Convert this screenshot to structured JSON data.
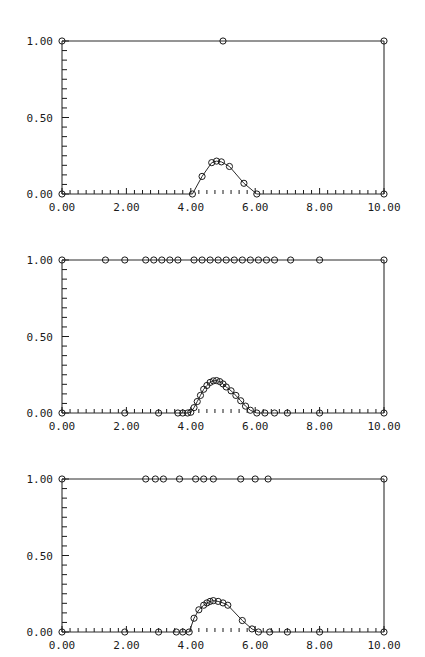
{
  "figure": {
    "title": "",
    "background_color": "#ffffff",
    "line_color": "#2a2a2a",
    "marker_color": "#1a1a1a",
    "axis_color": "#1a1a1a",
    "panel_count": 3,
    "layout": "3 stacked panels, shared axis style"
  },
  "axes": {
    "xlim": [
      0,
      10
    ],
    "ylim": [
      0,
      1
    ],
    "xticks": [
      0,
      2,
      4,
      6,
      8,
      10
    ],
    "xtick_labels": [
      "0.00",
      "2.00",
      "4.00",
      "6.00",
      "8.00",
      "10.00"
    ],
    "yticks": [
      0,
      0.5,
      1
    ],
    "ytick_labels": [
      "0.00",
      "0.50",
      "1.00"
    ],
    "x_minor_interval": 0.25,
    "y_minor_interval": 0.0625,
    "grid": false,
    "xlabel": "",
    "ylabel": ""
  },
  "chart_data": {
    "type": "line",
    "title": "",
    "xlabel": "",
    "ylabel": "",
    "xlim": [
      0,
      10
    ],
    "ylim": [
      0,
      1
    ],
    "xticks": [
      0,
      2,
      4,
      6,
      8,
      10
    ],
    "xtick_labels": [
      "0.00",
      "2.00",
      "4.00",
      "6.00",
      "8.00",
      "10.00"
    ],
    "yticks": [
      0,
      0.5,
      1
    ],
    "ytick_labels": [
      "0.00",
      "0.50",
      "1.00"
    ],
    "grid": false,
    "legend": "none",
    "marker": "open-circle",
    "panels": [
      {
        "name": "panel-1",
        "index": 0,
        "description": "coarse sampling: sparse markers, 3 points on upper line, 9 points on lower curve",
        "series": [
          {
            "name": "upper",
            "x": [
              0.0,
              5.0,
              10.0
            ],
            "y": [
              1.0,
              1.0,
              1.0
            ]
          },
          {
            "name": "lower",
            "x": [
              0.0,
              4.05,
              4.35,
              4.65,
              4.8,
              4.95,
              5.2,
              5.65,
              6.05,
              10.0
            ],
            "y": [
              0.0,
              0.0,
              0.115,
              0.205,
              0.215,
              0.21,
              0.18,
              0.07,
              0.0,
              0.0
            ]
          }
        ]
      },
      {
        "name": "panel-2",
        "index": 1,
        "description": "fine sampling: many markers on both upper line and lower curve",
        "series": [
          {
            "name": "upper",
            "x": [
              0.0,
              1.35,
              1.95,
              2.6,
              2.85,
              3.1,
              3.35,
              3.6,
              4.1,
              4.35,
              4.6,
              4.85,
              5.1,
              5.35,
              5.6,
              5.85,
              6.1,
              6.35,
              6.6,
              7.1,
              8.0,
              10.0
            ],
            "y": [
              1.0,
              1.0,
              1.0,
              1.0,
              1.0,
              1.0,
              1.0,
              1.0,
              1.0,
              1.0,
              1.0,
              1.0,
              1.0,
              1.0,
              1.0,
              1.0,
              1.0,
              1.0,
              1.0,
              1.0,
              1.0,
              1.0
            ]
          },
          {
            "name": "lower",
            "x": [
              0.0,
              1.95,
              3.0,
              3.6,
              3.75,
              3.9,
              4.0,
              4.1,
              4.2,
              4.3,
              4.4,
              4.5,
              4.6,
              4.7,
              4.8,
              4.9,
              5.0,
              5.1,
              5.25,
              5.4,
              5.55,
              5.7,
              5.85,
              6.05,
              6.3,
              6.6,
              7.0,
              8.0,
              10.0
            ],
            "y": [
              0.0,
              0.0,
              0.0,
              0.0,
              0.0,
              0.0,
              0.005,
              0.035,
              0.075,
              0.115,
              0.155,
              0.18,
              0.2,
              0.21,
              0.212,
              0.205,
              0.19,
              0.17,
              0.145,
              0.115,
              0.08,
              0.045,
              0.018,
              0.0,
              0.0,
              0.0,
              0.0,
              0.0,
              0.0
            ]
          }
        ]
      },
      {
        "name": "panel-3",
        "index": 2,
        "description": "medium sampling: moderate marker density on both curves",
        "series": [
          {
            "name": "upper",
            "x": [
              0.0,
              2.6,
              2.9,
              3.15,
              3.65,
              4.15,
              4.4,
              4.7,
              5.55,
              6.0,
              6.4,
              10.0
            ],
            "y": [
              1.0,
              1.0,
              1.0,
              1.0,
              1.0,
              1.0,
              1.0,
              1.0,
              1.0,
              1.0,
              1.0,
              1.0
            ]
          },
          {
            "name": "lower",
            "x": [
              0.0,
              1.95,
              3.0,
              3.55,
              3.75,
              3.95,
              4.1,
              4.25,
              4.4,
              4.5,
              4.6,
              4.7,
              4.85,
              5.0,
              5.15,
              5.6,
              5.9,
              6.1,
              6.45,
              7.0,
              8.0,
              10.0
            ],
            "y": [
              0.0,
              0.0,
              0.0,
              0.0,
              0.0,
              0.0,
              0.09,
              0.145,
              0.175,
              0.19,
              0.2,
              0.205,
              0.2,
              0.19,
              0.175,
              0.075,
              0.02,
              0.0,
              0.0,
              0.0,
              0.0,
              0.0
            ]
          }
        ]
      }
    ]
  }
}
